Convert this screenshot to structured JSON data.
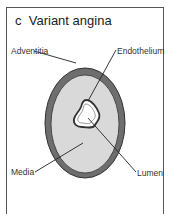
{
  "diagram": {
    "panel_letter": "c",
    "title": "Variant angina",
    "labels": {
      "adventitia": "Adventitia",
      "endothelium": "Endothelium",
      "media": "Media",
      "lumen": "Lumen"
    },
    "colors": {
      "adventitia": "#6e6e6e",
      "media": "#d9d9d9",
      "lumen": "#ffffff",
      "outline": "#333333"
    }
  }
}
